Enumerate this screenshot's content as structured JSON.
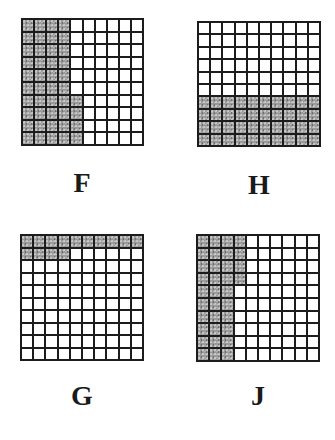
{
  "figures": [
    {
      "id": "F",
      "label": "F",
      "rows": 10,
      "cols": 10,
      "shaded_count": 44,
      "description": "Columns 1-4 fully shaded; column 5 shaded in rows 7-10",
      "shaded": [
        [
          1,
          1,
          1,
          1,
          0,
          0,
          0,
          0,
          0,
          0
        ],
        [
          1,
          1,
          1,
          1,
          0,
          0,
          0,
          0,
          0,
          0
        ],
        [
          1,
          1,
          1,
          1,
          0,
          0,
          0,
          0,
          0,
          0
        ],
        [
          1,
          1,
          1,
          1,
          0,
          0,
          0,
          0,
          0,
          0
        ],
        [
          1,
          1,
          1,
          1,
          0,
          0,
          0,
          0,
          0,
          0
        ],
        [
          1,
          1,
          1,
          1,
          0,
          0,
          0,
          0,
          0,
          0
        ],
        [
          1,
          1,
          1,
          1,
          1,
          0,
          0,
          0,
          0,
          0
        ],
        [
          1,
          1,
          1,
          1,
          1,
          0,
          0,
          0,
          0,
          0
        ],
        [
          1,
          1,
          1,
          1,
          1,
          0,
          0,
          0,
          0,
          0
        ],
        [
          1,
          1,
          1,
          1,
          1,
          0,
          0,
          0,
          0,
          0
        ]
      ]
    },
    {
      "id": "H",
      "label": "H",
      "rows": 10,
      "cols": 10,
      "shaded_count": 40,
      "description": "Bottom 4 rows fully shaded",
      "shaded": [
        [
          0,
          0,
          0,
          0,
          0,
          0,
          0,
          0,
          0,
          0
        ],
        [
          0,
          0,
          0,
          0,
          0,
          0,
          0,
          0,
          0,
          0
        ],
        [
          0,
          0,
          0,
          0,
          0,
          0,
          0,
          0,
          0,
          0
        ],
        [
          0,
          0,
          0,
          0,
          0,
          0,
          0,
          0,
          0,
          0
        ],
        [
          0,
          0,
          0,
          0,
          0,
          0,
          0,
          0,
          0,
          0
        ],
        [
          0,
          0,
          0,
          0,
          0,
          0,
          0,
          0,
          0,
          0
        ],
        [
          1,
          1,
          1,
          1,
          1,
          1,
          1,
          1,
          1,
          1
        ],
        [
          1,
          1,
          1,
          1,
          1,
          1,
          1,
          1,
          1,
          1
        ],
        [
          1,
          1,
          1,
          1,
          1,
          1,
          1,
          1,
          1,
          1
        ],
        [
          1,
          1,
          1,
          1,
          1,
          1,
          1,
          1,
          1,
          1
        ]
      ]
    },
    {
      "id": "G",
      "label": "G",
      "rows": 10,
      "cols": 10,
      "shaded_count": 14,
      "description": "Row 1 fully shaded; row 2 first 4 cells shaded",
      "shaded": [
        [
          1,
          1,
          1,
          1,
          1,
          1,
          1,
          1,
          1,
          1
        ],
        [
          1,
          1,
          1,
          1,
          0,
          0,
          0,
          0,
          0,
          0
        ],
        [
          0,
          0,
          0,
          0,
          0,
          0,
          0,
          0,
          0,
          0
        ],
        [
          0,
          0,
          0,
          0,
          0,
          0,
          0,
          0,
          0,
          0
        ],
        [
          0,
          0,
          0,
          0,
          0,
          0,
          0,
          0,
          0,
          0
        ],
        [
          0,
          0,
          0,
          0,
          0,
          0,
          0,
          0,
          0,
          0
        ],
        [
          0,
          0,
          0,
          0,
          0,
          0,
          0,
          0,
          0,
          0
        ],
        [
          0,
          0,
          0,
          0,
          0,
          0,
          0,
          0,
          0,
          0
        ],
        [
          0,
          0,
          0,
          0,
          0,
          0,
          0,
          0,
          0,
          0
        ],
        [
          0,
          0,
          0,
          0,
          0,
          0,
          0,
          0,
          0,
          0
        ]
      ]
    },
    {
      "id": "J",
      "label": "J",
      "rows": 10,
      "cols": 10,
      "shaded_count": 34,
      "description": "Columns 1-3 fully shaded; column 4 shaded in rows 1-4",
      "shaded": [
        [
          1,
          1,
          1,
          1,
          0,
          0,
          0,
          0,
          0,
          0
        ],
        [
          1,
          1,
          1,
          1,
          0,
          0,
          0,
          0,
          0,
          0
        ],
        [
          1,
          1,
          1,
          1,
          0,
          0,
          0,
          0,
          0,
          0
        ],
        [
          1,
          1,
          1,
          1,
          0,
          0,
          0,
          0,
          0,
          0
        ],
        [
          1,
          1,
          1,
          0,
          0,
          0,
          0,
          0,
          0,
          0
        ],
        [
          1,
          1,
          1,
          0,
          0,
          0,
          0,
          0,
          0,
          0
        ],
        [
          1,
          1,
          1,
          0,
          0,
          0,
          0,
          0,
          0,
          0
        ],
        [
          1,
          1,
          1,
          0,
          0,
          0,
          0,
          0,
          0,
          0
        ],
        [
          1,
          1,
          1,
          0,
          0,
          0,
          0,
          0,
          0,
          0
        ],
        [
          1,
          1,
          1,
          0,
          0,
          0,
          0,
          0,
          0,
          0
        ]
      ]
    }
  ],
  "colors": {
    "grid_line": "#1c1c1c",
    "shaded_fill": "#9a9a9a",
    "empty_fill": "#ffffff",
    "label": "#1a1a1a"
  }
}
